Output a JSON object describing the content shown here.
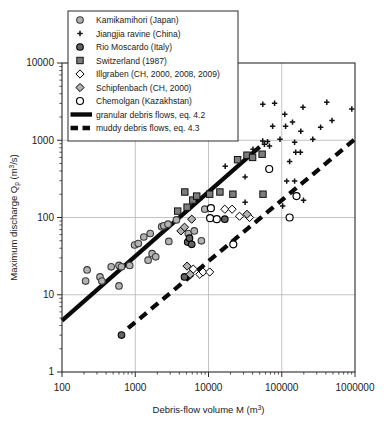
{
  "figure": {
    "background": "#ffffff",
    "frame_color": "#2b2b2b",
    "grid_color": "#b4b4b4",
    "text_color": "#1a1a1a"
  },
  "chart_data": {
    "type": "scatter",
    "title": "",
    "xlabel": "Debris-flow volume M (m³)",
    "ylabel": "Maximum discharge Qp (m³/s)",
    "xlabel_parts": {
      "main": "Debris-flow volume M (m",
      "sup": "3",
      "end": ")"
    },
    "ylabel_parts": {
      "main": "Maximum discharge Q",
      "sub": "p",
      "mid": " (m",
      "sup": "3",
      "end": "/s)"
    },
    "x_scale": "log",
    "y_scale": "log",
    "xlim": [
      100,
      1000000
    ],
    "ylim": [
      1,
      10000
    ],
    "x_ticks": [
      100,
      1000,
      10000,
      100000,
      1000000
    ],
    "x_tick_labels": [
      "100",
      "1000",
      "10000",
      "100000",
      "1000000"
    ],
    "y_ticks": [
      1,
      10,
      100,
      1000,
      10000
    ],
    "y_tick_labels": [
      "1",
      "10",
      "100",
      "1000",
      "10000"
    ],
    "grid": true,
    "legend_position": "top-left-inside",
    "series": [
      {
        "name": "Kamikamihori (Japan)",
        "marker": "circle",
        "fill": "#b2b2b2",
        "stroke": "#3c3c3c",
        "points": [
          [
            210,
            15
          ],
          [
            220,
            21
          ],
          [
            330,
            17
          ],
          [
            350,
            15
          ],
          [
            470,
            23
          ],
          [
            600,
            13
          ],
          [
            600,
            24
          ],
          [
            650,
            23
          ],
          [
            840,
            24
          ],
          [
            980,
            44
          ],
          [
            1100,
            46
          ],
          [
            1310,
            56
          ],
          [
            1500,
            28
          ],
          [
            1600,
            62
          ],
          [
            1700,
            34
          ],
          [
            1900,
            31
          ],
          [
            2300,
            76
          ],
          [
            2450,
            78
          ],
          [
            2800,
            82
          ],
          [
            2870,
            49
          ],
          [
            3650,
            93
          ],
          [
            5300,
            62
          ],
          [
            6400,
            67
          ],
          [
            8000,
            50
          ],
          [
            8900,
            128
          ]
        ]
      },
      {
        "name": "Jiangjia ravine (China)",
        "marker": "plus",
        "fill": "none",
        "stroke": "#111111",
        "points": [
          [
            16900,
            460
          ],
          [
            31600,
            335
          ],
          [
            31600,
            158
          ],
          [
            40500,
            766
          ],
          [
            55000,
            980
          ],
          [
            55200,
            2930
          ],
          [
            58000,
            890
          ],
          [
            64000,
            960
          ],
          [
            68000,
            840
          ],
          [
            75000,
            1520
          ],
          [
            79800,
            3020
          ],
          [
            94500,
            1030
          ],
          [
            103000,
            141
          ],
          [
            110000,
            2170
          ],
          [
            113000,
            1520
          ],
          [
            117000,
            296
          ],
          [
            128000,
            530
          ],
          [
            140000,
            1720
          ],
          [
            150000,
            940
          ],
          [
            150000,
            296
          ],
          [
            155000,
            700
          ],
          [
            180000,
            700
          ],
          [
            182000,
            1310
          ],
          [
            195000,
            2680
          ],
          [
            198000,
            167
          ],
          [
            265000,
            1030
          ],
          [
            339000,
            1470
          ],
          [
            412000,
            3100
          ],
          [
            485000,
            1800
          ],
          [
            903000,
            2540
          ]
        ]
      },
      {
        "name": "Rio Moscardo (Italy)",
        "marker": "circle",
        "fill": "#636363",
        "stroke": "#000000",
        "points": [
          [
            650,
            3
          ],
          [
            4700,
            17
          ],
          [
            5200,
            48
          ],
          [
            5500,
            54
          ],
          [
            5900,
            45
          ],
          [
            16700,
            95
          ]
        ]
      },
      {
        "name": "Switzerland (1987)",
        "marker": "square",
        "fill": "#7d7d7d",
        "stroke": "#111111",
        "points": [
          [
            3800,
            121
          ],
          [
            4740,
            214
          ],
          [
            5100,
            136
          ],
          [
            6100,
            168
          ],
          [
            6900,
            189
          ],
          [
            10400,
            200
          ],
          [
            14300,
            214
          ],
          [
            21500,
            200
          ],
          [
            25000,
            560
          ],
          [
            33500,
            640
          ],
          [
            40000,
            600
          ],
          [
            54000,
            660
          ],
          [
            55400,
            200
          ]
        ]
      },
      {
        "name": "Illgraben (CH, 2000, 2008, 2009)",
        "marker": "diamond",
        "fill": "#ffffff",
        "stroke": "#000000",
        "points": [
          [
            6200,
            21.5
          ],
          [
            7600,
            18.4
          ],
          [
            8400,
            19.7
          ],
          [
            10400,
            19.7
          ],
          [
            16700,
            128
          ],
          [
            21000,
            128
          ],
          [
            26500,
            104
          ],
          [
            36300,
            100
          ]
        ]
      },
      {
        "name": "Schipfenbach (CH, 2000)",
        "marker": "diamond",
        "fill": "#b2b2b2",
        "stroke": "#000000",
        "points": [
          [
            4200,
            67
          ],
          [
            4700,
            75
          ],
          [
            5900,
            95
          ],
          [
            5100,
            23.5
          ],
          [
            5600,
            18.4
          ],
          [
            33500,
            110
          ]
        ]
      },
      {
        "name": "Chemolgan (Kazakhstan)",
        "marker": "circle-open",
        "fill": "#ffffff",
        "stroke": "#000000",
        "points": [
          [
            10500,
            98
          ],
          [
            10800,
            132
          ],
          [
            13000,
            95
          ],
          [
            21800,
            45
          ],
          [
            67500,
            425
          ],
          [
            128000,
            100
          ],
          [
            159000,
            189
          ]
        ]
      }
    ],
    "lines": [
      {
        "name": "granular debris flows, eq. 4.2",
        "style": "solid",
        "color": "#0a0a0a",
        "equation": "Qp = 0.1 M^0.833",
        "coeff": 0.1,
        "exponent": 0.833,
        "M_range": [
          100,
          50000
        ]
      },
      {
        "name": "muddy debris flows, eq. 4.3",
        "style": "dashed",
        "color": "#0a0a0a",
        "equation": "Qp = 0.0188 M^0.79",
        "coeff": 0.0188,
        "exponent": 0.79,
        "M_range": [
          800,
          1000000
        ]
      }
    ]
  },
  "legend": {
    "entries": [
      "Kamikamihori (Japan)",
      "Jiangjia ravine (China)",
      "Rio Moscardo (Italy)",
      "Switzerland (1987)",
      "Illgraben (CH, 2000, 2008, 2009)",
      "Schipfenbach (CH, 2000)",
      "Chemolgan (Kazakhstan)",
      "granular debris flows, eq. 4.2",
      "muddy debris flows, eq. 4.3"
    ]
  }
}
